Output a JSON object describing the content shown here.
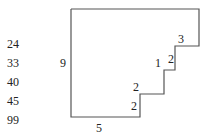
{
  "number_list": [
    "24",
    "33",
    "40",
    "45",
    "99"
  ],
  "shape": {
    "stroke_color": "#555555",
    "edge_labels": {
      "left": "9",
      "bottom": "5",
      "step1_top": "3",
      "step1_right": "2",
      "step2_top": "1",
      "step3_top": "2",
      "step3_right": "2"
    }
  }
}
